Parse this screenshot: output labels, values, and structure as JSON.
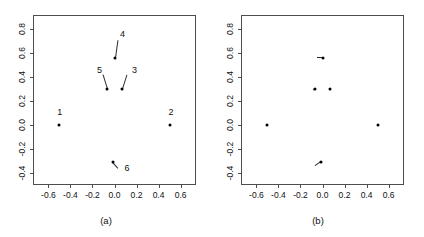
{
  "figure": {
    "width": 424,
    "height": 237,
    "background": "#ffffff",
    "foreground": "#000000",
    "axis_color": "#4d4d4d"
  },
  "chart_data": [
    {
      "type": "scatter",
      "panel_id": "a",
      "caption": "(a)",
      "title": "",
      "xlabel": "",
      "ylabel": "",
      "xlim": [
        -0.74,
        0.74
      ],
      "ylim": [
        -0.5,
        0.92
      ],
      "grid": false,
      "legend": "none",
      "xticks": [
        -0.6,
        -0.4,
        -0.2,
        0.0,
        0.2,
        0.4,
        0.6
      ],
      "xticklabels": [
        "-0.6",
        "-0.4",
        "-0.2",
        "0.0",
        "0.2",
        "0.4",
        "0.6"
      ],
      "yticks": [
        -0.4,
        -0.2,
        0.0,
        0.2,
        0.4,
        0.6,
        0.8
      ],
      "yticklabels": [
        "-0.4",
        "-0.2",
        "0.0",
        "0.2",
        "0.4",
        "0.6",
        "0.8"
      ],
      "points": [
        {
          "label": "1",
          "x": -0.5,
          "y": 0.0,
          "label_dx": -0.02,
          "label_dy": 0.1,
          "leader": false
        },
        {
          "label": "2",
          "x": 0.5,
          "y": 0.0,
          "label_dx": -0.01,
          "label_dy": 0.1,
          "leader": false
        },
        {
          "label": "3",
          "x": 0.07,
          "y": 0.3,
          "label_dx": 0.09,
          "label_dy": 0.15,
          "leader": true
        },
        {
          "label": "4",
          "x": 0.0,
          "y": 0.56,
          "label_dx": 0.05,
          "label_dy": 0.19,
          "leader": true
        },
        {
          "label": "5",
          "x": -0.07,
          "y": 0.3,
          "label_dx": -0.09,
          "label_dy": 0.15,
          "leader": true
        },
        {
          "label": "6",
          "x": -0.01,
          "y": -0.31,
          "label_dx": 0.1,
          "label_dy": -0.06,
          "leader": true
        }
      ]
    },
    {
      "type": "scatter",
      "panel_id": "b",
      "caption": "(b)",
      "title": "",
      "xlabel": "",
      "ylabel": "",
      "xlim": [
        -0.74,
        0.74
      ],
      "ylim": [
        -0.5,
        0.92
      ],
      "grid": false,
      "legend": "none",
      "xticks": [
        -0.6,
        -0.4,
        -0.2,
        0.0,
        0.2,
        0.4,
        0.6
      ],
      "xticklabels": [
        "-0.6",
        "-0.4",
        "-0.2",
        "0.0",
        "0.2",
        "0.4",
        "0.6"
      ],
      "yticks": [
        -0.4,
        -0.2,
        0.0,
        0.2,
        0.4,
        0.6,
        0.8
      ],
      "yticklabels": [
        "-0.4",
        "-0.2",
        "0.0",
        "0.2",
        "0.4",
        "0.6",
        "0.8"
      ],
      "points": [
        {
          "label": "",
          "x": -0.5,
          "y": 0.0,
          "leader": false
        },
        {
          "label": "",
          "x": 0.5,
          "y": 0.0,
          "leader": false
        },
        {
          "label": "",
          "x": 0.07,
          "y": 0.3,
          "leader": false
        },
        {
          "label": "",
          "x": 0.0,
          "y": 0.56,
          "leader": true,
          "leader_dx": -0.055,
          "leader_dy": 0.0
        },
        {
          "label": "",
          "x": -0.07,
          "y": 0.3,
          "leader": true,
          "leader_dx": -0.012,
          "leader_dy": -0.012
        },
        {
          "label": "",
          "x": -0.01,
          "y": -0.31,
          "leader": true,
          "leader_dx": -0.055,
          "leader_dy": -0.035
        }
      ]
    }
  ]
}
